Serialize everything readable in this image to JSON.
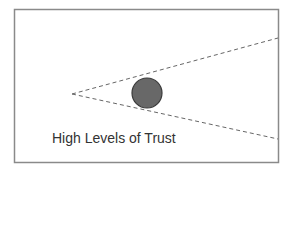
{
  "diagram": {
    "caption": "High Levels of Trust",
    "frame": {
      "x": 14,
      "y": 9,
      "width": 264,
      "height": 153,
      "stroke": "#8a8a8a"
    },
    "cone": {
      "apex": {
        "x": 72,
        "y": 94
      },
      "upper_end": {
        "x": 278,
        "y": 38
      },
      "lower_end": {
        "x": 278,
        "y": 139
      },
      "stroke": "#666666",
      "dash": "4,3"
    },
    "circle": {
      "cx": 147,
      "cy": 93,
      "r": 15,
      "fill": "#686868",
      "stroke": "#3a3a3a"
    }
  }
}
